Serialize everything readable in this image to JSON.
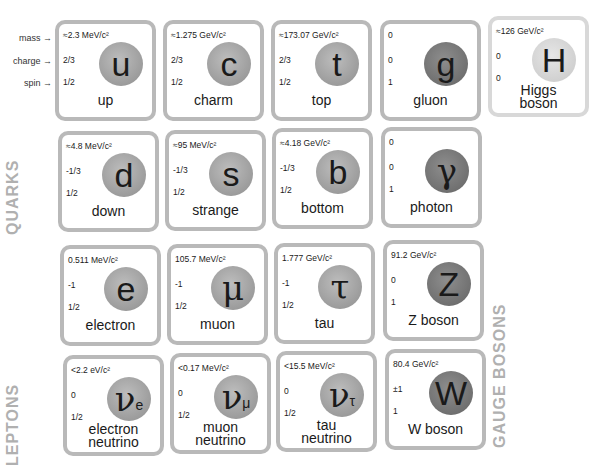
{
  "legend": {
    "mass": "mass →",
    "charge": "charge →",
    "spin": "spin →"
  },
  "groups": {
    "quarks": "QUARKS",
    "leptons": "LEPTONS",
    "gauge_bosons": "GAUGE BOSONS"
  },
  "particles": {
    "up": {
      "mass": "≈2.3 MeV/c²",
      "charge": "2/3",
      "spin": "1/2",
      "symbol": "u",
      "name": "up"
    },
    "charm": {
      "mass": "≈1.275 GeV/c²",
      "charge": "2/3",
      "spin": "1/2",
      "symbol": "c",
      "name": "charm"
    },
    "top": {
      "mass": "≈173.07 GeV/c²",
      "charge": "2/3",
      "spin": "1/2",
      "symbol": "t",
      "name": "top"
    },
    "gluon": {
      "mass": "0",
      "charge": "0",
      "spin": "1",
      "symbol": "g",
      "name": "gluon"
    },
    "higgs": {
      "mass": "≈126 GeV/c²",
      "charge": "0",
      "spin": "0",
      "symbol": "H",
      "name1": "Higgs",
      "name2": "boson"
    },
    "down": {
      "mass": "≈4.8 MeV/c²",
      "charge": "-1/3",
      "spin": "1/2",
      "symbol": "d",
      "name": "down"
    },
    "strange": {
      "mass": "≈95 MeV/c²",
      "charge": "-1/3",
      "spin": "1/2",
      "symbol": "s",
      "name": "strange"
    },
    "bottom": {
      "mass": "≈4.18 GeV/c²",
      "charge": "-1/3",
      "spin": "1/2",
      "symbol": "b",
      "name": "bottom"
    },
    "photon": {
      "mass": "0",
      "charge": "0",
      "spin": "1",
      "symbol": "γ",
      "name": "photon"
    },
    "electron": {
      "mass": "0.511 MeV/c²",
      "charge": "-1",
      "spin": "1/2",
      "symbol": "e",
      "name": "electron"
    },
    "muon": {
      "mass": "105.7 MeV/c²",
      "charge": "-1",
      "spin": "1/2",
      "symbol": "μ",
      "name": "muon"
    },
    "tau": {
      "mass": "1.777 GeV/c²",
      "charge": "-1",
      "spin": "1/2",
      "symbol": "τ",
      "name": "tau"
    },
    "zboson": {
      "mass": "91.2 GeV/c²",
      "charge": "0",
      "spin": "1",
      "symbol": "Z",
      "name": "Z boson"
    },
    "nu_e": {
      "mass": "<2.2 eV/c²",
      "charge": "0",
      "spin": "1/2",
      "symbol": "ν",
      "sub": "e",
      "name1": "electron",
      "name2": "neutrino"
    },
    "nu_mu": {
      "mass": "<0.17 MeV/c²",
      "charge": "0",
      "spin": "1/2",
      "symbol": "ν",
      "sub": "μ",
      "name1": "muon",
      "name2": "neutrino"
    },
    "nu_tau": {
      "mass": "<15.5 MeV/c²",
      "charge": "0",
      "spin": "1/2",
      "symbol": "ν",
      "sub": "τ",
      "name1": "tau",
      "name2": "neutrino"
    },
    "wboson": {
      "mass": "80.4 GeV/c²",
      "charge": "±1",
      "spin": "1",
      "symbol": "W",
      "name": "W boson"
    }
  }
}
